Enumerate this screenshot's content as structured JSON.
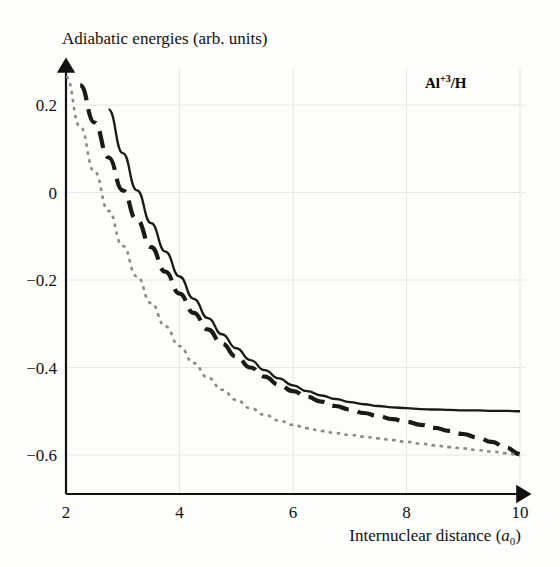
{
  "figure": {
    "ylabel": "Adiabatic energies (arb. units)",
    "xlabel_main": "Internuclear distance (",
    "xlabel_sym": "a",
    "xlabel_sub": "0",
    "xlabel_close": ")",
    "system_label_main": "Al",
    "system_label_sup": "+3",
    "system_label_tail": "/H",
    "colors": {
      "curve_solid": "#1a1a1a",
      "curve_dashed": "#1a1a1a",
      "curve_dotted": "#8a8a8a",
      "axis": "#111111",
      "grid": "#e6e6e6",
      "background": "#fdfdfb"
    }
  },
  "chart_data": {
    "type": "line",
    "title": "",
    "xlabel": "Internuclear distance (a0)",
    "ylabel": "Adiabatic energies (arb. units)",
    "xlim": [
      2,
      10
    ],
    "ylim": [
      -0.68,
      0.33
    ],
    "grid": true,
    "legend": null,
    "annotations": [
      {
        "text": "Al+3/H",
        "x": 8.7,
        "y": 0.26
      }
    ],
    "xticks": [
      2,
      4,
      6,
      8,
      10
    ],
    "xticklabels": [
      "2",
      "4",
      "6",
      "8",
      "10"
    ],
    "yticks": [
      0.2,
      0,
      -0.2,
      -0.4,
      -0.6
    ],
    "yticklabels": [
      "0.2",
      "0",
      "−0.2",
      "−0.4",
      "−0.6"
    ],
    "x": [
      2.0,
      2.25,
      2.5,
      2.75,
      3.0,
      3.25,
      3.5,
      3.75,
      4.0,
      4.25,
      4.5,
      4.75,
      5.0,
      5.25,
      5.5,
      5.75,
      6.0,
      6.25,
      6.5,
      6.75,
      7.0,
      7.25,
      7.5,
      7.75,
      8.0,
      8.25,
      8.5,
      8.75,
      9.0,
      9.25,
      9.5,
      9.75,
      10.0
    ],
    "series": [
      {
        "name": "upper adiabatic state",
        "style": "solid",
        "color": "#1a1a1a",
        "x_start": 2.5,
        "values": [
          null,
          null,
          0.305,
          0.19,
          0.09,
          0.005,
          -0.07,
          -0.135,
          -0.192,
          -0.243,
          -0.287,
          -0.324,
          -0.356,
          -0.383,
          -0.406,
          -0.425,
          -0.441,
          -0.454,
          -0.464,
          -0.472,
          -0.479,
          -0.484,
          -0.488,
          -0.491,
          -0.493,
          -0.495,
          -0.496,
          -0.497,
          -0.498,
          -0.498,
          -0.499,
          -0.499,
          -0.5
        ]
      },
      {
        "name": "middle adiabatic state",
        "style": "dashed",
        "color": "#1a1a1a",
        "x_start": 2.05,
        "values": [
          0.33,
          0.245,
          0.16,
          0.08,
          0.005,
          -0.063,
          -0.125,
          -0.181,
          -0.231,
          -0.275,
          -0.313,
          -0.346,
          -0.375,
          -0.4,
          -0.421,
          -0.439,
          -0.454,
          -0.467,
          -0.478,
          -0.488,
          -0.496,
          -0.504,
          -0.511,
          -0.518,
          -0.524,
          -0.531,
          -0.538,
          -0.545,
          -0.552,
          -0.56,
          -0.57,
          -0.583,
          -0.598
        ]
      },
      {
        "name": "lower adiabatic state",
        "style": "dotted",
        "color": "#8a8a8a",
        "x_start": 2.0,
        "values": [
          0.265,
          0.15,
          0.048,
          -0.042,
          -0.122,
          -0.192,
          -0.253,
          -0.306,
          -0.351,
          -0.39,
          -0.423,
          -0.451,
          -0.474,
          -0.493,
          -0.508,
          -0.521,
          -0.531,
          -0.539,
          -0.545,
          -0.55,
          -0.554,
          -0.558,
          -0.562,
          -0.566,
          -0.57,
          -0.574,
          -0.578,
          -0.582,
          -0.585,
          -0.589,
          -0.592,
          -0.596,
          -0.6
        ]
      }
    ]
  }
}
